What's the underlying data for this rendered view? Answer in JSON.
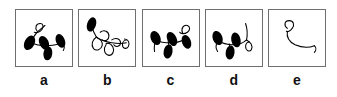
{
  "figure": {
    "type": "multi-panel-line-drawing-figure",
    "panel_count": 5,
    "background_color": "#ffffff",
    "border_color": "#6f6f6f",
    "ink_color": "#000000",
    "panels": [
      {
        "label": "a",
        "description": "Curved stem with three solid black leaf-shaped ellipses and one open outlined loop at upper left",
        "filled_leaves": 3,
        "open_loops": 1
      },
      {
        "label": "b",
        "description": "Wavy looping stem with one solid black blob at upper left and three open outlined loops along the line",
        "filled_leaves": 1,
        "open_loops": 3
      },
      {
        "label": "c",
        "description": "Curved stem with four solid black leaf-shaped ellipses and one open outlined loop at upper right",
        "filled_leaves": 4,
        "open_loops": 1
      },
      {
        "label": "d",
        "description": "Curved stem with three solid black leaf-shaped ellipses and one open outlined loop at right",
        "filled_leaves": 3,
        "open_loops": 1
      },
      {
        "label": "e",
        "description": "Bare curved stem with a single small open outlined loop at upper left, no filled leaves",
        "filled_leaves": 0,
        "open_loops": 1
      }
    ]
  }
}
